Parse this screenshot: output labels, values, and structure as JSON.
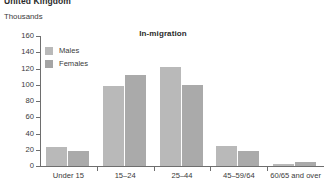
{
  "region_title": "United Kingdom",
  "units_label": "Thousands",
  "legend": {
    "males_label": "Males",
    "females_label": "Females",
    "males_color": "#b9b9b9",
    "females_color": "#a5a5a5"
  },
  "chart_data": {
    "type": "bar",
    "title": "In-migration",
    "xlabel": "",
    "ylabel": "Thousands",
    "ylim": [
      0,
      160
    ],
    "yticks": [
      0,
      20,
      40,
      60,
      80,
      100,
      120,
      140,
      160
    ],
    "grid": false,
    "legend_position": "top-left",
    "categories": [
      "Under 15",
      "15–24",
      "25–44",
      "45–59/64",
      "60/65 and over"
    ],
    "series": [
      {
        "name": "Males",
        "values": [
          23,
          99,
          122,
          25,
          3
        ]
      },
      {
        "name": "Females",
        "values": [
          18,
          112,
          100,
          18,
          5
        ]
      }
    ]
  }
}
